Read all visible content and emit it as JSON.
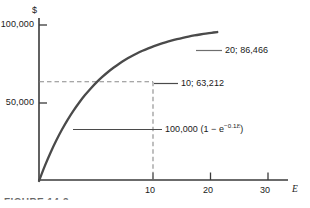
{
  "chart_data": {
    "type": "line",
    "title": "",
    "xlabel": "E",
    "ylabel": "$",
    "xlim": [
      0,
      32.5
    ],
    "ylim": [
      0,
      108000
    ],
    "grid": false,
    "legend": "none",
    "curve": {
      "name": "100,000 (1 - e^-0.1E)",
      "formula_label": "100,000 (1 − e",
      "formula_exponent_sign": "−0.1",
      "formula_exponent_var": "E",
      "formula_tail": ")",
      "x": [
        0,
        1,
        2,
        3,
        4,
        5,
        6,
        7,
        8,
        9,
        10,
        11,
        12,
        13,
        14,
        15,
        16,
        17,
        18,
        19,
        20,
        21,
        22,
        23,
        24,
        25,
        26,
        27,
        28,
        29,
        30,
        31
      ],
      "y": [
        0,
        9516,
        18127,
        25918,
        32968,
        39347,
        45119,
        50341,
        55067,
        59343,
        63212,
        66713,
        69881,
        72747,
        75340,
        77687,
        79810,
        81732,
        83470,
        85043,
        86466,
        87754,
        88920,
        89974,
        90928,
        91792,
        92573,
        93279,
        93919,
        94497,
        95021,
        95495
      ]
    },
    "x_ticks": [
      {
        "value": 10,
        "label": "10"
      },
      {
        "value": 20,
        "label": "20"
      },
      {
        "value": 30,
        "label": "30"
      }
    ],
    "y_ticks": [
      {
        "value": 50000,
        "label": "50,000"
      },
      {
        "value": 100000,
        "label": "100,000"
      }
    ],
    "annotations": [
      {
        "name": "point-20",
        "label": "20; 86,466",
        "x": 20,
        "y": 86466
      },
      {
        "name": "point-10",
        "label": "10; 63,212",
        "x": 10,
        "y": 63212
      }
    ],
    "guide_lines": [
      {
        "name": "horizontal-guide",
        "from": [
          0,
          63212
        ],
        "to": [
          10,
          63212
        ],
        "style": "dashed"
      },
      {
        "name": "vertical-guide",
        "from": [
          10,
          0
        ],
        "to": [
          10,
          63212
        ],
        "style": "dashed"
      }
    ],
    "colors": {
      "curve": "#4a4a4a",
      "axis": "#3a3a3a",
      "guide": "#8a8a8a",
      "text": "#1a1a1a"
    }
  },
  "figure": {
    "caption": "FIGURE 14-3"
  }
}
